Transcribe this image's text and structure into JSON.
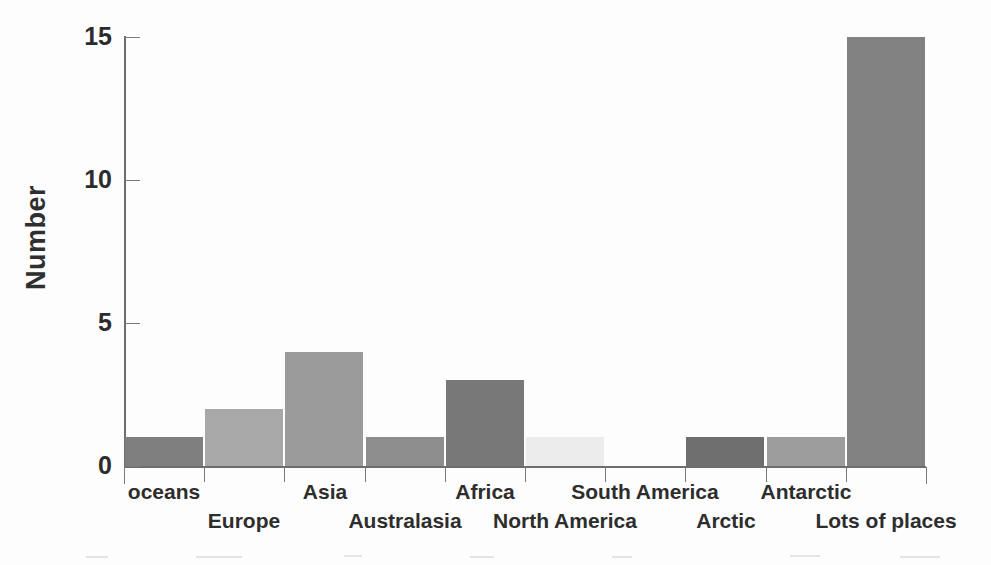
{
  "chart_data": {
    "type": "bar",
    "title": "",
    "xlabel": "",
    "ylabel": "Number",
    "ylim": [
      0,
      15
    ],
    "ytick_labels": [
      "0",
      "5",
      "10",
      "15"
    ],
    "ytick_values": [
      0,
      5,
      10,
      15
    ],
    "grid": false,
    "legend": "none",
    "categories": [
      "oceans",
      "Europe",
      "Asia",
      "Australasia",
      "Africa",
      "North America",
      "South America",
      "Arctic",
      "Antarctic",
      "Lots of places"
    ],
    "values": [
      1,
      2,
      4,
      1,
      3,
      1,
      0,
      1,
      1,
      15
    ],
    "bar_colors": [
      "#7f7f7f",
      "#a8a8a8",
      "#9b9b9b",
      "#8d8d8d",
      "#787878",
      "#ececec",
      "#ffffff",
      "#6f6f6f",
      "#9d9d9d",
      "#828282"
    ],
    "label_rows": [
      0,
      1,
      0,
      1,
      0,
      1,
      0,
      1,
      0,
      1
    ]
  },
  "axis": {
    "line_color": "#6d6d6d",
    "tick_color": "#7a7a7a",
    "text_color": "#2c2c2c"
  }
}
